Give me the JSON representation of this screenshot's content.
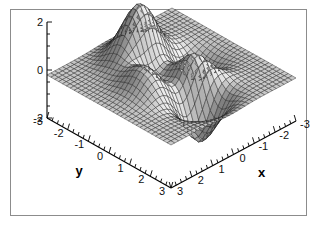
{
  "figure": {
    "background_color": "#ffffff",
    "frame_color": "#8c8c8c",
    "frame": {
      "x": 10,
      "y": 9,
      "width": 297,
      "height": 207
    }
  },
  "chart_data": {
    "type": "surface",
    "title": "",
    "subtitle": "",
    "xlabel": "x",
    "ylabel": "y",
    "zlabel": "",
    "grid": false,
    "legend": "none",
    "projection": "3d-oblique",
    "surface_style": {
      "mesh_color": "#1a1a1a",
      "face_light": "#f2f2f2",
      "face_dark": "#4a4a4a",
      "shading": "lighting-gradient-gray"
    },
    "xlim": [
      -3,
      3
    ],
    "ylim": [
      -3,
      3
    ],
    "zlim": [
      -2,
      2
    ],
    "x_ticks": [
      3,
      2,
      1,
      0,
      -1,
      -2,
      -3
    ],
    "x_tick_labels": [
      "3",
      "2",
      "1",
      "0",
      "-1",
      "-2",
      "-3"
    ],
    "y_ticks": [
      -3,
      -2,
      -1,
      0,
      1,
      2,
      3
    ],
    "y_tick_labels": [
      "-3",
      "-2",
      "-1",
      "0",
      "1",
      "2",
      "3"
    ],
    "z_ticks": [
      2,
      0,
      -2
    ],
    "z_tick_labels": [
      "2",
      "0",
      "-2"
    ],
    "x_minor_ticks_per_interval": 4,
    "y_minor_ticks_per_interval": 4,
    "z_minor_ticks_per_interval": 4,
    "mesh_resolution": {
      "nx": 33,
      "ny": 33
    },
    "function": "peaks",
    "surface_features": [
      {
        "name": "sharp-peak",
        "x": -0.1,
        "y": -1.6,
        "z": 2.0
      },
      {
        "name": "broad-hump",
        "x": 1.2,
        "y": -1.9,
        "z": 1.6
      },
      {
        "name": "deep-valley",
        "x": 0.3,
        "y": 1.6,
        "z": -2.0
      },
      {
        "name": "left-ridge",
        "x": -1.6,
        "y": 0.4,
        "z": 0.9
      }
    ],
    "view": {
      "azimuth": -37.5,
      "elevation": 30
    }
  },
  "axes": {
    "z_axis_name": "z-axis",
    "y_axis_name": "y-axis",
    "x_axis_name": "x-axis"
  }
}
